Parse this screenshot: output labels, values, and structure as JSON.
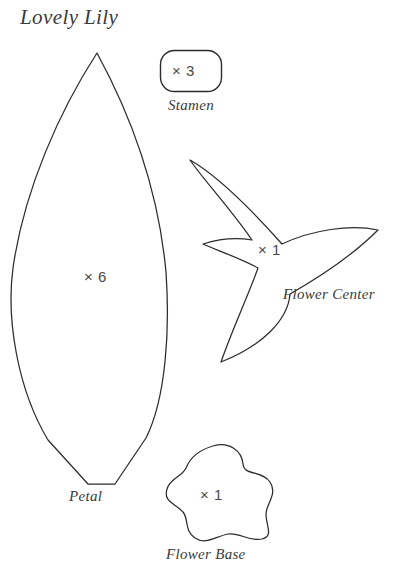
{
  "sheet": {
    "title": "Lovely Lily",
    "background_color": "#ffffff",
    "stroke_color": "#2b2b2b",
    "text_color": "#3a3a3a"
  },
  "pieces": [
    {
      "id": "petal",
      "name": "Petal",
      "label": "Petal",
      "quantity_text": "× 6",
      "quantity": 6,
      "shape": "pointed-leaf-lens"
    },
    {
      "id": "stamen",
      "name": "Stamen",
      "label": "Stamen",
      "quantity_text": "× 3",
      "quantity": 3,
      "shape": "rounded-rectangle"
    },
    {
      "id": "flower-center",
      "name": "Flower Center",
      "label": "Flower Center",
      "quantity_text": "× 1",
      "quantity": 1,
      "shape": "three-point-star"
    },
    {
      "id": "flower-base",
      "name": "Flower Base",
      "label": "Flower Base",
      "quantity_text": "× 1",
      "quantity": 1,
      "shape": "five-lobed-blob"
    }
  ]
}
